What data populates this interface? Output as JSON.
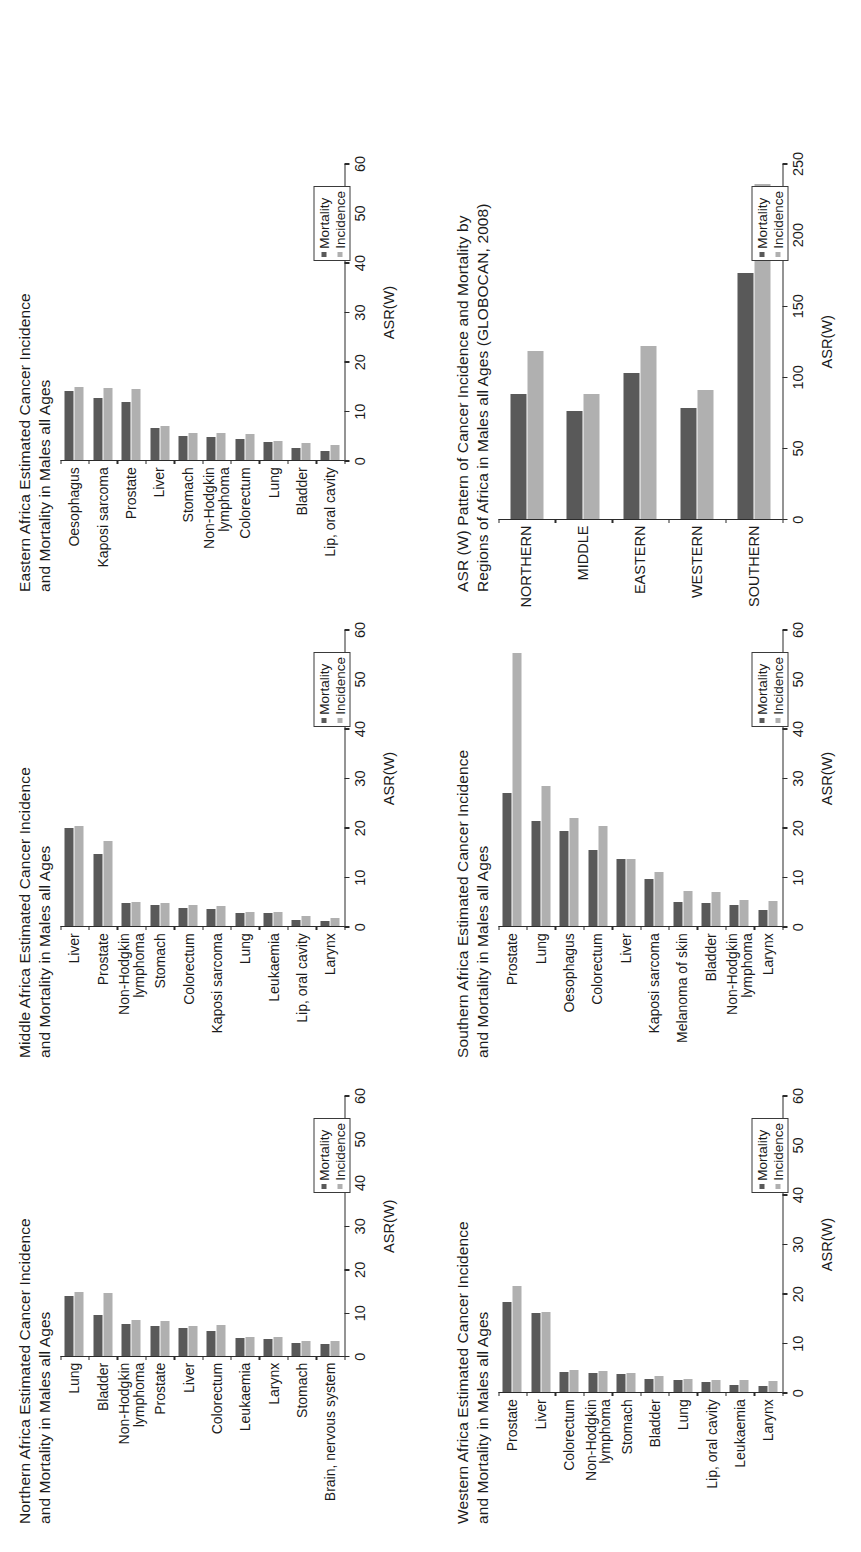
{
  "legend": {
    "mortality_label": "Mortality",
    "incidence_label": "Incidence",
    "mortality_color": "#595959",
    "incidence_color": "#b0b0b0"
  },
  "axis": {
    "title": "ASR(W)"
  },
  "panels": {
    "northern": {
      "title": "Northern Africa Estimated Cancer Incidence\nand Mortality in Males all Ages"
    },
    "middle": {
      "title": "Middle Africa Estimated Cancer Incidence\nand Mortality in Males all Ages"
    },
    "eastern": {
      "title": "Eastern Africa Estimated Cancer Incidence\nand Mortality in Males all Ages"
    },
    "western": {
      "title": "Western Africa Estimated Cancer Incidence\nand Mortality in Males all Ages"
    },
    "southern": {
      "title": "Southern Africa Estimated Cancer Incidence\nand Mortality in Males all Ages"
    },
    "regions": {
      "title": "ASR (W) Pattern of Cancer Incidence and Mortality by\nRegions of Africa in Males all Ages (GLOBOCAN, 2008)"
    }
  },
  "chart_data": [
    {
      "id": "northern",
      "type": "bar",
      "orientation": "horizontal",
      "title": "Northern Africa Estimated Cancer Incidence and Mortality in Males all Ages",
      "xlabel": "ASR(W)",
      "ylabel": "",
      "xlim": [
        0,
        60
      ],
      "xticks": [
        0,
        10,
        20,
        30,
        40,
        50,
        60
      ],
      "grid": false,
      "legend_position": "bottom-right",
      "categories": [
        "Lung",
        "Bladder",
        "Non-Hodgkin\nlymphoma",
        "Prostate",
        "Liver",
        "Colorectum",
        "Leukaemia",
        "Larynx",
        "Stomach",
        "Brain, nervous system"
      ],
      "series": [
        {
          "name": "Mortality",
          "color": "#595959",
          "values": [
            13.8,
            9.4,
            7.4,
            6.9,
            6.4,
            5.6,
            4.1,
            3.9,
            3.0,
            2.8
          ]
        },
        {
          "name": "Incidence",
          "color": "#b0b0b0",
          "values": [
            14.7,
            14.6,
            8.2,
            8.0,
            6.8,
            7.2,
            4.4,
            4.3,
            3.5,
            3.4
          ]
        }
      ]
    },
    {
      "id": "middle",
      "type": "bar",
      "orientation": "horizontal",
      "title": "Middle Africa Estimated Cancer Incidence and Mortality in Males all Ages",
      "xlabel": "ASR(W)",
      "ylabel": "",
      "xlim": [
        0,
        60
      ],
      "xticks": [
        0,
        10,
        20,
        30,
        40,
        50,
        60
      ],
      "grid": false,
      "legend_position": "bottom-right",
      "categories": [
        "Liver",
        "Prostate",
        "Non-Hodgkin\nlymphoma",
        "Stomach",
        "Colorectum",
        "Kaposi sarcoma",
        "Lung",
        "Leukaemia",
        "Lip, oral cavity",
        "Larynx"
      ],
      "series": [
        {
          "name": "Mortality",
          "color": "#595959",
          "values": [
            19.8,
            14.6,
            4.6,
            4.2,
            3.6,
            3.5,
            2.7,
            2.6,
            1.3,
            1.1
          ]
        },
        {
          "name": "Incidence",
          "color": "#b0b0b0",
          "values": [
            20.3,
            17.2,
            4.9,
            4.7,
            4.2,
            4.1,
            2.8,
            2.8,
            2.0,
            1.7
          ]
        }
      ]
    },
    {
      "id": "eastern",
      "type": "bar",
      "orientation": "horizontal",
      "title": "Eastern Africa Estimated Cancer Incidence and Mortality in Males all Ages",
      "xlabel": "ASR(W)",
      "ylabel": "",
      "xlim": [
        0,
        60
      ],
      "xticks": [
        0,
        10,
        20,
        30,
        40,
        50,
        60
      ],
      "grid": false,
      "legend_position": "bottom-right",
      "categories": [
        "Oesophagus",
        "Kaposi sarcoma",
        "Prostate",
        "Liver",
        "Stomach",
        "Non-Hodgkin\nlymphoma",
        "Colorectum",
        "Lung",
        "Bladder",
        "Lip, oral cavity"
      ],
      "series": [
        {
          "name": "Mortality",
          "color": "#595959",
          "values": [
            14.1,
            12.7,
            11.8,
            6.6,
            5.0,
            4.7,
            4.3,
            3.7,
            2.5,
            1.8
          ]
        },
        {
          "name": "Incidence",
          "color": "#b0b0b0",
          "values": [
            14.8,
            14.7,
            14.4,
            7.0,
            5.6,
            5.5,
            5.3,
            3.9,
            3.4,
            3.0
          ]
        }
      ]
    },
    {
      "id": "western",
      "type": "bar",
      "orientation": "horizontal",
      "title": "Western Africa Estimated Cancer Incidence and Mortality in Males all Ages",
      "xlabel": "ASR(W)",
      "ylabel": "",
      "xlim": [
        0,
        60
      ],
      "xticks": [
        0,
        10,
        20,
        30,
        40,
        50,
        60
      ],
      "grid": false,
      "legend_position": "bottom-right",
      "categories": [
        "Prostate",
        "Liver",
        "Colorectum",
        "Non-Hodgkin\nlymphoma",
        "Stomach",
        "Bladder",
        "Lung",
        "Lip, oral cavity",
        "Leukaemia",
        "Larynx"
      ],
      "series": [
        {
          "name": "Mortality",
          "color": "#595959",
          "values": [
            18.3,
            16.1,
            4.0,
            3.8,
            3.6,
            2.7,
            2.5,
            2.1,
            1.4,
            1.3
          ]
        },
        {
          "name": "Incidence",
          "color": "#b0b0b0",
          "values": [
            21.5,
            16.2,
            4.5,
            4.2,
            3.8,
            3.2,
            2.6,
            2.5,
            2.5,
            2.2
          ]
        }
      ]
    },
    {
      "id": "southern",
      "type": "bar",
      "orientation": "horizontal",
      "title": "Southern Africa Estimated Cancer Incidence and Mortality in Males all Ages",
      "xlabel": "ASR(W)",
      "ylabel": "",
      "xlim": [
        0,
        60
      ],
      "xticks": [
        0,
        10,
        20,
        30,
        40,
        50,
        60
      ],
      "grid": false,
      "legend_position": "bottom-right",
      "categories": [
        "Prostate",
        "Lung",
        "Oesophagus",
        "Colorectum",
        "Liver",
        "Kaposi sarcoma",
        "Melanoma of skin",
        "Bladder",
        "Non-Hodgkin\nlymphoma",
        "Larynx"
      ],
      "series": [
        {
          "name": "Mortality",
          "color": "#595959",
          "values": [
            27.0,
            21.3,
            19.3,
            15.5,
            13.6,
            9.5,
            4.9,
            4.8,
            4.3,
            3.3
          ]
        },
        {
          "name": "Incidence",
          "color": "#b0b0b0",
          "values": [
            55.4,
            28.5,
            22.0,
            20.2,
            13.6,
            11.0,
            7.2,
            7.0,
            5.4,
            5.2
          ]
        }
      ]
    },
    {
      "id": "regions",
      "type": "bar",
      "orientation": "horizontal",
      "title": "ASR (W) Pattern of Cancer Incidence and Mortality by Regions of Africa in Males all Ages (GLOBOCAN, 2008)",
      "xlabel": "ASR(W)",
      "ylabel": "",
      "xlim": [
        0,
        250
      ],
      "xticks": [
        0,
        50,
        100,
        150,
        200,
        250
      ],
      "grid": false,
      "legend_position": "bottom-right",
      "categories": [
        "NORTHERN",
        "MIDDLE",
        "EASTERN",
        "WESTERN",
        "SOUTHERN"
      ],
      "series": [
        {
          "name": "Mortality",
          "color": "#595959",
          "values": [
            88,
            76,
            103,
            78,
            173
          ]
        },
        {
          "name": "Incidence",
          "color": "#b0b0b0",
          "values": [
            118,
            88,
            122,
            91,
            236
          ]
        }
      ]
    }
  ]
}
